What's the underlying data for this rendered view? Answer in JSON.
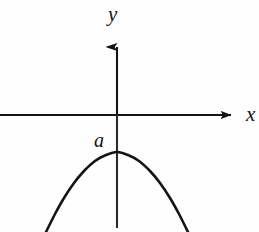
{
  "figure": {
    "background_color": "#fefefe",
    "stroke_color": "#141414",
    "width": 259,
    "height": 232
  },
  "labels": {
    "y_axis": "y",
    "x_axis": "x",
    "vertex": "a"
  },
  "chart_data": {
    "type": "line",
    "title": "",
    "subtitle": "",
    "xlabel": "x",
    "ylabel": "y",
    "grid": false,
    "legend": null,
    "axes": {
      "origin_px": [
        117,
        115
      ],
      "x_axis": {
        "y_px": 115,
        "start_px": 0,
        "end_px": 238,
        "arrow": "right",
        "label": "x",
        "ticks": [],
        "tick_labels": []
      },
      "y_axis": {
        "x_px": 117,
        "top_px": 36,
        "bottom_px": 228,
        "arrow": "up",
        "label": "y",
        "ticks": [],
        "tick_labels": []
      }
    },
    "annotations": [
      {
        "text": "a",
        "meaning": "y-intercept / vertex height of the parabola",
        "x_px": 102,
        "y_px": 140,
        "anchor_px": [
          117,
          152
        ]
      }
    ],
    "curves": [
      {
        "name": "parabola",
        "shape": "downward-opening parabola",
        "equation": "y = a - k*x^2",
        "vertex_px": [
          117,
          152
        ],
        "opens": "down",
        "symmetry_axis": "y-axis",
        "stroke_width_px": 2.6,
        "points_px": [
          [
            46,
            232
          ],
          [
            55,
            214
          ],
          [
            64,
            198
          ],
          [
            74,
            183
          ],
          [
            84,
            171
          ],
          [
            95,
            161
          ],
          [
            106,
            155
          ],
          [
            117,
            152
          ],
          [
            128,
            155
          ],
          [
            139,
            161
          ],
          [
            150,
            171
          ],
          [
            160,
            183
          ],
          [
            170,
            198
          ],
          [
            179,
            214
          ],
          [
            188,
            232
          ]
        ]
      }
    ]
  }
}
